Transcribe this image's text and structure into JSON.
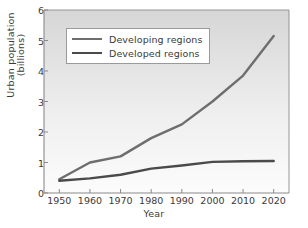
{
  "chart_data": {
    "type": "line",
    "title": "",
    "xlabel": "Year",
    "ylabel": "Urban population (billions)",
    "ylabel_lines": [
      "Urban population",
      "(billions)"
    ],
    "x": [
      1950,
      1960,
      1970,
      1980,
      1990,
      2000,
      2010,
      2020
    ],
    "xticklabels": [
      "1950",
      "1960",
      "1970",
      "1980",
      "1990",
      "2000",
      "2010",
      "2020"
    ],
    "yticklabels": [
      "0",
      "1",
      "2",
      "3",
      "4",
      "5",
      "6"
    ],
    "yticks": [
      0,
      1,
      2,
      3,
      4,
      5,
      6
    ],
    "xlim": [
      1945,
      2025
    ],
    "ylim": [
      0,
      6
    ],
    "grid": false,
    "legend_position": "upper left",
    "series": [
      {
        "name": "Developing regions",
        "color": "#6e6e6e",
        "values": [
          0.45,
          1.0,
          1.2,
          1.8,
          2.25,
          3.0,
          3.85,
          5.15
        ]
      },
      {
        "name": "Developed regions",
        "color": "#4a4a4a",
        "values": [
          0.4,
          0.48,
          0.6,
          0.8,
          0.9,
          1.02,
          1.04,
          1.05
        ]
      }
    ]
  },
  "style": {
    "plot_bg_top": "#d9d9d9",
    "plot_bg_bottom": "#fbfbfb",
    "axis_color": "#8a8a8a",
    "text_color": "#3a3a3a",
    "legend_bg": "#ffffff",
    "legend_border": "#9a9a9a"
  }
}
